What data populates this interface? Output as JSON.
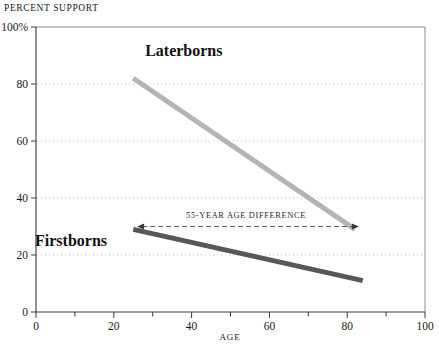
{
  "chart_data": {
    "type": "line",
    "title": "",
    "ylabel": "PERCENT SUPPORT",
    "xlabel": "AGE",
    "xlim": [
      0,
      100
    ],
    "ylim": [
      0,
      100
    ],
    "grid": "horizontal-dotted",
    "legend": "inline-labels",
    "x_ticks": [
      "0",
      "20",
      "40",
      "60",
      "80",
      "100"
    ],
    "x_tick_values": [
      0,
      20,
      40,
      60,
      80,
      100
    ],
    "x_minor_tick_values": [
      10,
      30,
      50,
      70,
      90
    ],
    "y_ticks": [
      "0",
      "20",
      "40",
      "60",
      "80",
      "100%"
    ],
    "y_tick_values": [
      0,
      20,
      40,
      60,
      80,
      100
    ],
    "y_gridline_values": [
      20,
      40,
      60,
      80
    ],
    "series": [
      {
        "name": "Laterborns",
        "color": "#b4b4b4",
        "width": 5,
        "label_x": 38,
        "label_y": 90,
        "points": [
          {
            "x": 25,
            "y": 82
          },
          {
            "x": 82,
            "y": 29
          }
        ]
      },
      {
        "name": "Firstborns",
        "color": "#575757",
        "width": 5,
        "label_x": 9,
        "label_y": 23,
        "points": [
          {
            "x": 25,
            "y": 29
          },
          {
            "x": 84,
            "y": 11
          }
        ]
      }
    ],
    "annotations": [
      {
        "text": "55-YEAR AGE DIFFERENCE",
        "style": "double-arrow-dashed",
        "x_start": 26,
        "x_end": 83,
        "y": 30,
        "text_x": 54,
        "text_y": 33
      }
    ]
  }
}
